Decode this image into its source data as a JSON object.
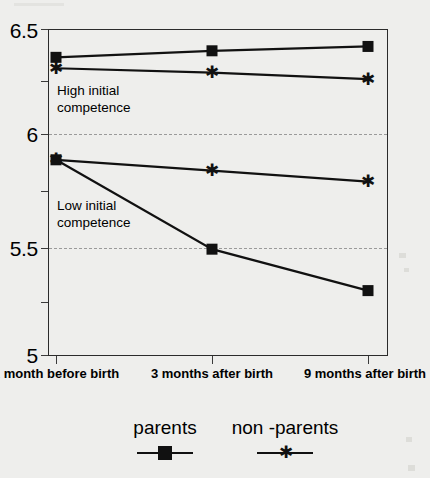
{
  "chart_data": {
    "type": "line",
    "title": "",
    "xlabel": "",
    "ylabel": "",
    "ylim": [
      5,
      6.5
    ],
    "yticks": [
      5,
      5.5,
      6,
      6.5
    ],
    "ytick_labels": [
      "5",
      "5.5",
      "6",
      "6.5"
    ],
    "gridlines": [
      5.5,
      6
    ],
    "grid": "horizontal-dashed",
    "legend_position": "bottom",
    "categories": [
      "1 month before birth",
      "3 months after birth",
      "9 months after birth"
    ],
    "x_tick_labels": [
      "1 month before\nbirth",
      "3 months after\nbirth",
      "9 months after\nbirth"
    ],
    "annotations": [
      {
        "text": "High initial\ncompetence",
        "group": "high"
      },
      {
        "text": "Low initial\ncompetence",
        "group": "low"
      }
    ],
    "series": [
      {
        "name": "parents",
        "group": "High initial competence",
        "marker": "filled-square",
        "values": [
          6.37,
          6.4,
          6.42
        ]
      },
      {
        "name": "non -parents",
        "group": "High initial competence",
        "marker": "star",
        "values": [
          6.32,
          6.3,
          6.27
        ]
      },
      {
        "name": "parents",
        "group": "Low initial competence",
        "marker": "filled-square",
        "values": [
          5.9,
          5.49,
          5.3
        ]
      },
      {
        "name": "non -parents",
        "group": "Low initial competence",
        "marker": "star",
        "values": [
          5.9,
          5.85,
          5.8
        ]
      }
    ]
  },
  "axis": {
    "y_label_0": "6.5",
    "y_label_1": "6",
    "y_label_2": "5.5",
    "y_label_3": "5",
    "x_label_0": "1 month before\nbirth",
    "x_label_1": "3 months after\nbirth",
    "x_label_2": "9 months after\nbirth"
  },
  "annotations": {
    "high": "High initial\ncompetence",
    "low": "Low initial\ncompetence"
  },
  "legend": {
    "entries": [
      {
        "label": "parents",
        "marker": "filled-square"
      },
      {
        "label": "non -parents",
        "marker": "star"
      }
    ]
  },
  "colors": {
    "background": "#eeeeec",
    "ink": "#111111",
    "frame": "#2b2b2b",
    "gridline": "#9a9a9a"
  }
}
